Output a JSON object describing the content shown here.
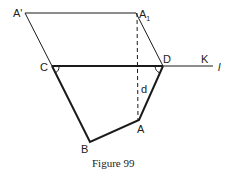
{
  "figure": {
    "caption": "Figure 99",
    "labels": {
      "A_prime": "A'",
      "A1": "A",
      "A1_sub": "1",
      "C": "C",
      "D": "D",
      "K": "K",
      "l": "l",
      "d": "d",
      "A": "A",
      "B": "B"
    },
    "points": {
      "A_prime": [
        25,
        13
      ],
      "A1": [
        136,
        13
      ],
      "C": [
        52,
        66
      ],
      "D": [
        163,
        66
      ],
      "A": [
        139,
        120
      ],
      "B": [
        90,
        142
      ],
      "l_end": [
        213,
        66
      ]
    },
    "colors": {
      "stroke": "#1a1a1a"
    }
  }
}
